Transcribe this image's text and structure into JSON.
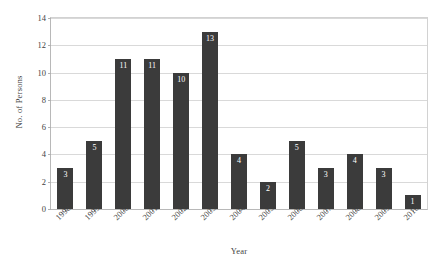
{
  "chart_data": {
    "type": "bar",
    "title": "",
    "subtitle": "",
    "xlabel": "Year",
    "ylabel": "No. of Persons",
    "categories": [
      "1998",
      "1999",
      "2000",
      "2001",
      "2002",
      "2003",
      "2004",
      "2005",
      "2006",
      "2007",
      "2008",
      "2009",
      "2010"
    ],
    "values": [
      3,
      5,
      11,
      11,
      10,
      13,
      4,
      2,
      5,
      3,
      4,
      3,
      1
    ],
    "data_labels": [
      "3",
      "5",
      "11",
      "11",
      "10",
      "13",
      "4",
      "2",
      "5",
      "3",
      "4",
      "3",
      "1"
    ],
    "ylim": [
      0,
      14
    ],
    "ytick_labels": [
      "0",
      "2",
      "4",
      "6",
      "8",
      "10",
      "12",
      "14"
    ],
    "ytick_values": [
      0,
      2,
      4,
      6,
      8,
      10,
      12,
      14
    ],
    "grid": true,
    "grid_orientation": "horizontal",
    "legend": false,
    "legend_position": "none",
    "bar_color": "#3b3b3b",
    "data_label_color": "#ffffff",
    "gridline_color": "#d9d9d9",
    "axis_color": "#b8b8b8",
    "background_color": "#ffffff",
    "xtick_label_rotation": -45
  }
}
